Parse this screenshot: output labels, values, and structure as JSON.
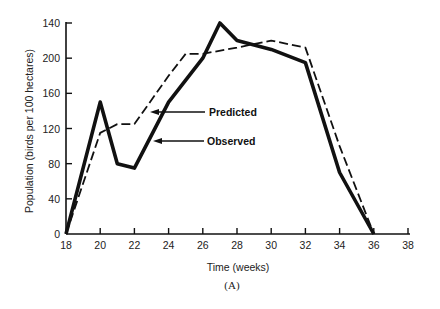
{
  "chart_data": {
    "type": "line",
    "title": "",
    "caption": "(A)",
    "xlabel": "Time (weeks)",
    "ylabel": "Population (birds per 100 hectares)",
    "xlim": [
      18,
      38
    ],
    "ylim": [
      0,
      240
    ],
    "x_ticks": [
      18,
      20,
      22,
      24,
      26,
      28,
      30,
      32,
      34,
      36,
      38
    ],
    "y_ticks": [
      0,
      40,
      80,
      120,
      160,
      200,
      240
    ],
    "y_tick_labels": [
      "0",
      "40",
      "80",
      "120",
      "160",
      "200",
      "140"
    ],
    "grid": false,
    "legend": "inline arrow labels",
    "series": [
      {
        "name": "Predicted",
        "style": "dashed",
        "x": [
          18,
          20,
          21,
          22,
          24,
          25,
          26,
          28,
          30,
          32,
          34,
          36
        ],
        "values": [
          0,
          115,
          125,
          125,
          180,
          205,
          205,
          212,
          220,
          212,
          100,
          0
        ]
      },
      {
        "name": "Observed",
        "style": "solid-thick",
        "x": [
          18,
          20,
          21,
          22,
          24,
          26,
          27,
          28,
          30,
          32,
          34,
          36
        ],
        "values": [
          0,
          150,
          80,
          75,
          150,
          200,
          240,
          220,
          210,
          195,
          70,
          0
        ]
      }
    ],
    "annotations": [
      {
        "text": "Predicted",
        "arrow_to": "predicted line near week 23"
      },
      {
        "text": "Observed",
        "arrow_to": "observed line near week 23"
      }
    ]
  },
  "labels": {
    "xlabel": "Time (weeks)",
    "ylabel": "Population (birds per 100 hectares)",
    "caption": "(A)",
    "predicted": "Predicted",
    "observed": "Observed"
  },
  "colors": {
    "line": "#111111",
    "background": "#ffffff"
  }
}
